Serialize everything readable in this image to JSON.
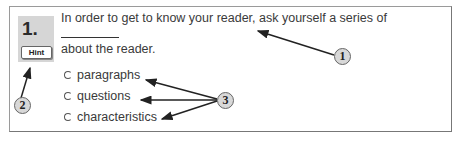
{
  "question": {
    "number": "1.",
    "hint_label": "Hint",
    "text_before_blank": "In order to get to know your reader, ask yourself a series of",
    "text_after_blank": "about the reader.",
    "options": [
      {
        "label": "paragraphs",
        "selected": false
      },
      {
        "label": "questions",
        "selected": false
      },
      {
        "label": "characteristics",
        "selected": false
      }
    ]
  },
  "callouts": {
    "one": "1",
    "two": "2",
    "three": "3"
  }
}
